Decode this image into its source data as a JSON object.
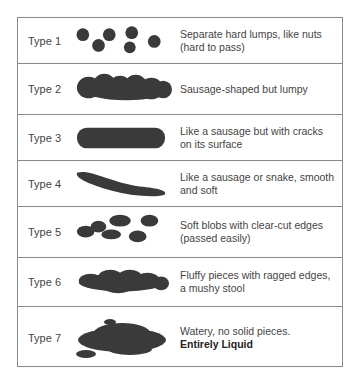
{
  "chart": {
    "stool_color": "#3a3a3a",
    "border_color": "#8a8a8a",
    "rows": [
      {
        "label": "Type 1",
        "description": "Separate hard lumps, like nuts (hard to pass)",
        "emphasis": ""
      },
      {
        "label": "Type 2",
        "description": "Sausage-shaped but lumpy",
        "emphasis": ""
      },
      {
        "label": "Type 3",
        "description": "Like a sausage but with cracks on its surface",
        "emphasis": ""
      },
      {
        "label": "Type 4",
        "description": "Like a sausage or snake, smooth and soft",
        "emphasis": ""
      },
      {
        "label": "Type 5",
        "description": "Soft blobs with clear-cut edges (passed easily)",
        "emphasis": ""
      },
      {
        "label": "Type 6",
        "description": "Fluffy pieces with ragged edges, a mushy stool",
        "emphasis": ""
      },
      {
        "label": "Type 7",
        "description": "Watery, no solid pieces.",
        "emphasis": "Entirely Liquid"
      }
    ]
  }
}
